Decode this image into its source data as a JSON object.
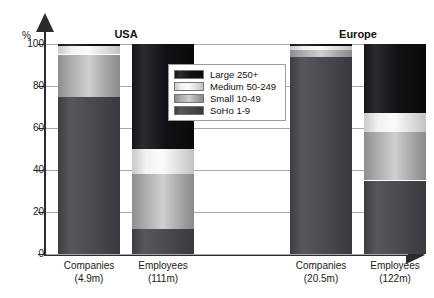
{
  "chart_data": {
    "type": "bar",
    "subtype": "stacked-100-percent",
    "title": "",
    "xlabel": "",
    "ylabel": "%",
    "ylim": [
      0,
      100
    ],
    "yticks": [
      0,
      20,
      40,
      60,
      80,
      100
    ],
    "grid": true,
    "legend_position": "center",
    "groups": [
      "USA",
      "Europe"
    ],
    "categories": [
      "Companies (4.9m)",
      "Employees (111m)",
      "Companies (20.5m)",
      "Employees (122m)"
    ],
    "series": [
      {
        "name": "Large 250+",
        "values": [
          1,
          50,
          1,
          33
        ]
      },
      {
        "name": "Medium 50-249",
        "values": [
          4,
          12,
          2,
          9
        ]
      },
      {
        "name": "Small 10-49",
        "values": [
          20,
          26,
          3,
          23
        ]
      },
      {
        "name": "SoHo 1-9",
        "values": [
          75,
          12,
          94,
          35
        ]
      }
    ]
  },
  "axis": {
    "percent_symbol": "%",
    "ticks": [
      "100",
      "80",
      "60",
      "40",
      "20",
      "0"
    ]
  },
  "groups": [
    {
      "title": "USA"
    },
    {
      "title": "Europe"
    }
  ],
  "bars": [
    {
      "group": "USA",
      "label": "Companies",
      "sublabel": "(4.9m)",
      "segments": [
        {
          "key": "large",
          "value": 1
        },
        {
          "key": "medium",
          "value": 4
        },
        {
          "key": "small",
          "value": 20
        },
        {
          "key": "soho",
          "value": 75
        }
      ]
    },
    {
      "group": "USA",
      "label": "Employees",
      "sublabel": "(111m)",
      "segments": [
        {
          "key": "large",
          "value": 50
        },
        {
          "key": "medium",
          "value": 12
        },
        {
          "key": "small",
          "value": 26
        },
        {
          "key": "soho",
          "value": 12
        }
      ]
    },
    {
      "group": "Europe",
      "label": "Companies",
      "sublabel": "(20.5m)",
      "segments": [
        {
          "key": "large",
          "value": 1
        },
        {
          "key": "medium",
          "value": 2
        },
        {
          "key": "small",
          "value": 3
        },
        {
          "key": "soho",
          "value": 94
        }
      ]
    },
    {
      "group": "Europe",
      "label": "Employees",
      "sublabel": "(122m)",
      "segments": [
        {
          "key": "large",
          "value": 33
        },
        {
          "key": "medium",
          "value": 9
        },
        {
          "key": "small",
          "value": 23
        },
        {
          "key": "soho",
          "value": 35
        }
      ]
    }
  ],
  "legend": {
    "items": [
      {
        "key": "large",
        "label": "Large 250+"
      },
      {
        "key": "medium",
        "label": "Medium 50-249"
      },
      {
        "key": "small",
        "label": "Small 10-49"
      },
      {
        "key": "soho",
        "label": "SoHo 1-9"
      }
    ]
  },
  "colors": {
    "large": "#111115",
    "medium": "#f2f2f2",
    "small": "#b4b4b4",
    "soho": "#4a4a50",
    "axis": "#2b2b2b",
    "grid": "#a9a9a9",
    "background": "#ffffff"
  }
}
